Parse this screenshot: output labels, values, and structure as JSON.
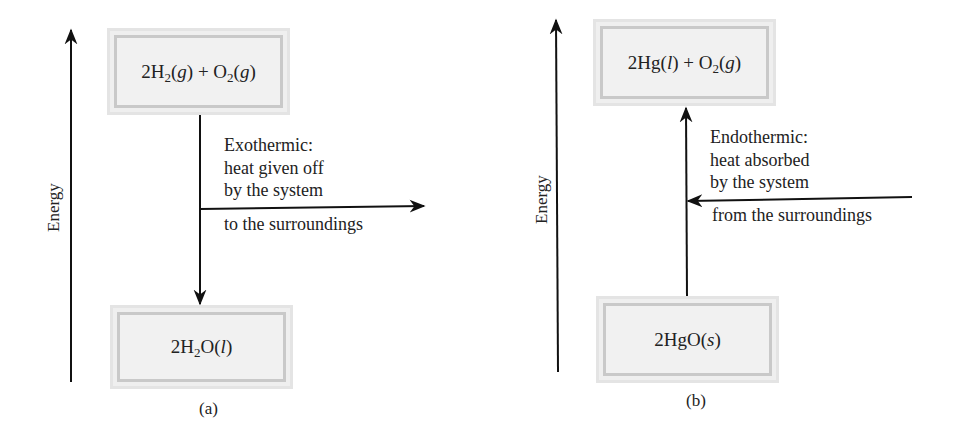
{
  "panels": [
    {
      "id": "a",
      "caption": "(a)",
      "axis_label": "Energy",
      "top_state": {
        "prefix": "2H",
        "sub1": "2",
        "mid": "(",
        "italic1": "g",
        "mid2": ") + O",
        "sub2": "2",
        "mid3": "(",
        "italic2": "g",
        "end": ")"
      },
      "bottom_state": {
        "prefix": "2H",
        "sub1": "2",
        "mid": "O(",
        "italic1": "l",
        "end": ")"
      },
      "process_title": "Exothermic:",
      "process_line2": "heat given off",
      "process_line3": "by the system",
      "process_line4": "to the surroundings",
      "direction": "down"
    },
    {
      "id": "b",
      "caption": "(b)",
      "axis_label": "Energy",
      "top_state": {
        "prefix": "2Hg(",
        "italic1": "l",
        "mid": ") + O",
        "sub1": "2",
        "mid2": "(",
        "italic2": "g",
        "end": ")"
      },
      "bottom_state": {
        "prefix": "2HgO(",
        "italic1": "s",
        "end": ")"
      },
      "process_title": "Endothermic:",
      "process_line2": "heat absorbed",
      "process_line3": "by the system",
      "process_line4": "from the surroundings",
      "direction": "up"
    }
  ],
  "colors": {
    "line": "#111111",
    "box_fill": "#f1f1f1",
    "box_border": "#c9c9c9"
  }
}
